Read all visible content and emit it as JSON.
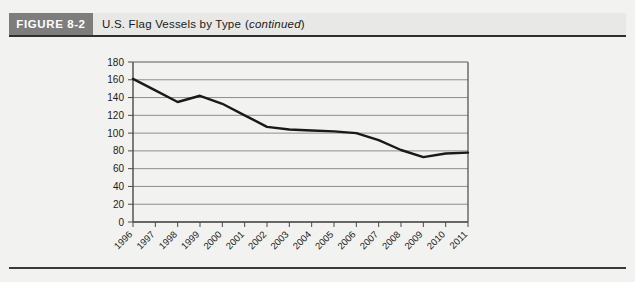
{
  "figure": {
    "tag": "FIGURE 8-2",
    "caption_main": "U.S. Flag Vessels by Type",
    "caption_open_paren": "(",
    "caption_continued": "continued",
    "caption_close_paren": ")"
  },
  "colors": {
    "header_bar": "#7d7d7d",
    "header_bg": "#e8e8e6",
    "page_bg": "#f2f2f1",
    "line": "#1a1a1a",
    "gridline": "#8e8e8e",
    "axis": "#4a4a4a",
    "text": "#1c1c1c",
    "rule": "#3a3a3a"
  },
  "chart_data": {
    "type": "line",
    "title": "U.S. Flag Vessels by Type (continued)",
    "xlabel": "",
    "ylabel": "",
    "categories": [
      "1996",
      "1997",
      "1998",
      "1999",
      "2000",
      "2001",
      "2002",
      "2003",
      "2004",
      "2005",
      "2006",
      "2007",
      "2008",
      "2009",
      "2010",
      "2011"
    ],
    "values": [
      161,
      148,
      135,
      142,
      133,
      120,
      107,
      104,
      103,
      102,
      100,
      92,
      81,
      73,
      77,
      78
    ],
    "series": [
      {
        "name": "U.S. Flag Vessels",
        "values": [
          161,
          148,
          135,
          142,
          133,
          120,
          107,
          104,
          103,
          102,
          100,
          92,
          81,
          73,
          77,
          78
        ]
      }
    ],
    "ylim": [
      0,
      180
    ],
    "ytick_step": 20,
    "yticks": [
      0,
      20,
      40,
      60,
      80,
      100,
      120,
      140,
      160,
      180
    ],
    "ytick_labels": [
      "0",
      "20",
      "40",
      "60",
      "80",
      "100",
      "120",
      "140",
      "160",
      "180"
    ],
    "xtick_labels": [
      "1996",
      "1997",
      "1998",
      "1999",
      "2000",
      "2001",
      "2002",
      "2003",
      "2004",
      "2005",
      "2006",
      "2007",
      "2008",
      "2009",
      "2010",
      "2011"
    ],
    "xtick_rotation_deg": -45,
    "grid": true,
    "grid_axis": "y",
    "legend": false,
    "legend_position": "none",
    "markers": false
  }
}
